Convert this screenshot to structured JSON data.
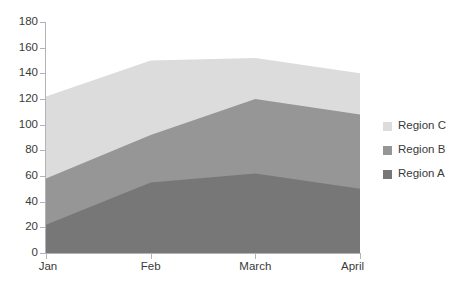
{
  "chart_data": {
    "type": "area",
    "stacked": true,
    "title": "",
    "xlabel": "",
    "ylabel": "",
    "categories": [
      "Jan",
      "Feb",
      "March",
      "April"
    ],
    "ylim": [
      0,
      180
    ],
    "y_ticks": [
      0,
      20,
      40,
      60,
      80,
      100,
      120,
      140,
      160,
      180
    ],
    "grid": false,
    "legend_position": "right",
    "series": [
      {
        "name": "Region A",
        "color": "#777777",
        "values": [
          22,
          55,
          62,
          50
        ],
        "cumulative": [
          22,
          55,
          62,
          50
        ]
      },
      {
        "name": "Region B",
        "color": "#969696",
        "values": [
          36,
          37,
          58,
          58
        ],
        "cumulative": [
          58,
          92,
          120,
          108
        ]
      },
      {
        "name": "Region C",
        "color": "#dcdcdc",
        "values": [
          64,
          58,
          32,
          32
        ],
        "cumulative": [
          122,
          150,
          152,
          140
        ]
      }
    ]
  },
  "legend": {
    "items": [
      {
        "label": "Region C",
        "color": "#dcdcdc"
      },
      {
        "label": "Region B",
        "color": "#969696"
      },
      {
        "label": "Region A",
        "color": "#777777"
      }
    ]
  },
  "axes": {
    "y_labels": [
      "180",
      "160",
      "140",
      "120",
      "100",
      "80",
      "60",
      "40",
      "20",
      "0"
    ],
    "x_labels": [
      "Jan",
      "Feb",
      "March",
      "April"
    ]
  }
}
